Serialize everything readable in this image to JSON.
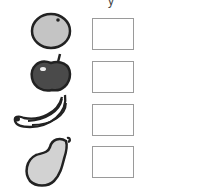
{
  "worksheet": {
    "top_mark": "y",
    "items": [
      {
        "fruit": "orange",
        "icon": "orange-icon",
        "box_value": ""
      },
      {
        "fruit": "apple",
        "icon": "apple-icon",
        "box_value": ""
      },
      {
        "fruit": "banana",
        "icon": "banana-icon",
        "box_value": ""
      },
      {
        "fruit": "pear",
        "icon": "pear-icon",
        "box_value": ""
      }
    ],
    "colors": {
      "outline": "#222222",
      "orange_fill": "#c4c4c4",
      "apple_fill": "#4a4a4a",
      "pear_fill": "#d2d2d2",
      "box_border": "#9a9a9a"
    }
  }
}
